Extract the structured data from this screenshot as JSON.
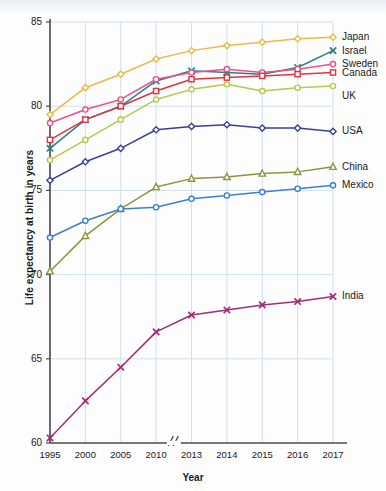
{
  "chart_data": {
    "type": "line",
    "title": "",
    "xlabel": "Year",
    "ylabel": "Life expectancy at birth in years",
    "categories": [
      "1995",
      "2000",
      "2005",
      "2010",
      "2013",
      "2014",
      "2015",
      "2016",
      "2017"
    ],
    "x_tick_labels": [
      "1995",
      "2000",
      "2005",
      "2010",
      "2013",
      "2014",
      "2015",
      "2016",
      "2017"
    ],
    "y_tick_labels": [
      "85",
      "80",
      "75",
      "70",
      "65",
      "60"
    ],
    "ylim": [
      60,
      85
    ],
    "y_ticks": [
      60,
      65,
      70,
      75,
      80,
      85
    ],
    "grid": true,
    "axis_break": {
      "between": [
        "2010",
        "2013"
      ],
      "symbol": "//"
    },
    "legend_position": "right-of-line-ends",
    "series": [
      {
        "name": "Japan",
        "color": "#e9b949",
        "marker": "diamond",
        "values": [
          79.5,
          81.1,
          81.9,
          82.8,
          83.3,
          83.6,
          83.8,
          84.0,
          84.1
        ]
      },
      {
        "name": "Israel",
        "color": "#2f7f86",
        "marker": "x",
        "values": [
          77.5,
          79.2,
          80.0,
          81.5,
          82.1,
          82.0,
          81.9,
          82.3,
          83.3
        ]
      },
      {
        "name": "Sweden",
        "color": "#e8538c",
        "marker": "circle",
        "values": [
          79.0,
          79.8,
          80.4,
          81.6,
          82.0,
          82.2,
          82.0,
          82.2,
          82.5
        ]
      },
      {
        "name": "Canada",
        "color": "#d8373f",
        "marker": "square",
        "values": [
          78.0,
          79.2,
          80.0,
          80.9,
          81.6,
          81.7,
          81.8,
          81.9,
          82.0
        ]
      },
      {
        "name": "UK",
        "color": "#b5c94a",
        "marker": "circle",
        "values": [
          76.8,
          78.0,
          79.2,
          80.4,
          81.0,
          81.3,
          80.9,
          81.1,
          81.2
        ]
      },
      {
        "name": "USA",
        "color": "#3b3f99",
        "marker": "diamond",
        "values": [
          75.6,
          76.7,
          77.5,
          78.6,
          78.8,
          78.9,
          78.7,
          78.7,
          78.5
        ]
      },
      {
        "name": "China",
        "color": "#8a9638",
        "marker": "triangle",
        "values": [
          70.2,
          72.3,
          73.9,
          75.2,
          75.7,
          75.8,
          76.0,
          76.1,
          76.4
        ]
      },
      {
        "name": "Mexico",
        "color": "#3b7fd1",
        "marker": "circle",
        "values": [
          72.2,
          73.2,
          73.9,
          74.0,
          74.5,
          74.7,
          74.9,
          75.1,
          75.3
        ]
      },
      {
        "name": "India",
        "color": "#a32d73",
        "marker": "x",
        "values": [
          60.3,
          62.5,
          64.5,
          66.6,
          67.6,
          67.9,
          68.2,
          68.4,
          68.7
        ]
      }
    ],
    "label_offsets": {
      "Japan": 0,
      "Israel": 0,
      "Sweden": 0,
      "Canada": 0,
      "UK": 10,
      "USA": 0,
      "China": 0,
      "Mexico": 0,
      "India": 0
    }
  }
}
